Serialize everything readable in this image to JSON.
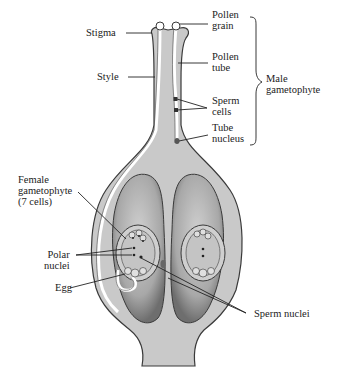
{
  "colors": {
    "tissue": "#c9c9c9",
    "tissue_light": "#dcdcdc",
    "ovule": "#b8b8b8",
    "ovule_dark": "#7a7a7a",
    "outline": "#3a3a3a",
    "tube": "#ffffff",
    "label": "#222222"
  },
  "labels": {
    "stigma": "Stigma",
    "style": "Style",
    "pollen_grain": "Pollen\ngrain",
    "pollen_tube": "Pollen\ntube",
    "sperm_cells": "Sperm\ncells",
    "tube_nucleus": "Tube\nnucleus",
    "male_gametophyte": "Male\ngametophyte",
    "female_gametophyte": "Female\ngametophyte\n(7 cells)",
    "polar_nuclei": "Polar\nnuclei",
    "egg": "Egg",
    "sperm_nuclei": "Sperm nuclei"
  }
}
